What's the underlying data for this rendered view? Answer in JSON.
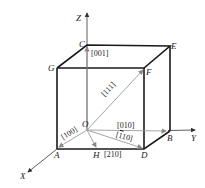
{
  "diagram": {
    "axes": {
      "x": "X",
      "y": "Y",
      "z": "Z"
    },
    "points": {
      "origin": "O",
      "A": "A",
      "B": "B",
      "C": "C",
      "D": "D",
      "E": "E",
      "F": "F",
      "G": "G",
      "H": "H"
    },
    "directions": {
      "d001": "[001]",
      "d100": "[100]",
      "d010": "[010]",
      "d111": "[111]",
      "d110_bar_prefix": "[",
      "d110_bar_digit": "1",
      "d110_rest": "10]",
      "d210": "[210]"
    },
    "colors": {
      "edge": "#1a1a1a",
      "vector": "#9a9a9a",
      "axis": "#333333"
    }
  }
}
